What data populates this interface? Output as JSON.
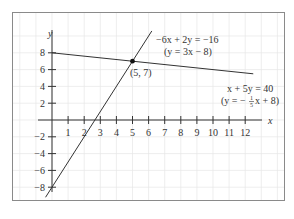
{
  "chart_data": {
    "type": "line",
    "title": "",
    "xlabel": "x",
    "ylabel": "y",
    "xlim": [
      -0.6,
      13.2
    ],
    "ylim": [
      -9.6,
      10.5
    ],
    "grid": true,
    "x_ticks": [
      "1",
      "2",
      "3",
      "4",
      "5",
      "6",
      "7",
      "8",
      "9",
      "10",
      "11",
      "12"
    ],
    "y_ticks": [
      "8",
      "6",
      "4",
      "2",
      "−2",
      "−4",
      "−6",
      "−8"
    ],
    "series": [
      {
        "name": "-6x + 2y = -16",
        "equation": "−6x + 2y = −16",
        "slope_form": "(y = 3x − 8)",
        "x": [
          -0.4,
          6.2
        ],
        "y": [
          -9.2,
          10.6
        ]
      },
      {
        "name": "x + 5y = 40",
        "equation": "x + 5y = 40",
        "slope_form": "(y = −⅕x + 8)",
        "x": [
          0,
          12.5
        ],
        "y": [
          8,
          5.5
        ]
      }
    ],
    "annotations": [
      {
        "label": "(5, 7)",
        "x": 5,
        "y": 7,
        "type": "intersection-point"
      }
    ]
  },
  "labels": {
    "axis_x": "x",
    "axis_y": "y",
    "point": "(5, 7)",
    "eq1_line1": "−6x + 2y = −16",
    "eq1_line2": "(y = 3x − 8)",
    "eq2_line1": "x + 5y = 40",
    "eq2_prefix": "(y = −",
    "eq2_num": "1",
    "eq2_den": "5",
    "eq2_suffix": "x + 8)"
  }
}
